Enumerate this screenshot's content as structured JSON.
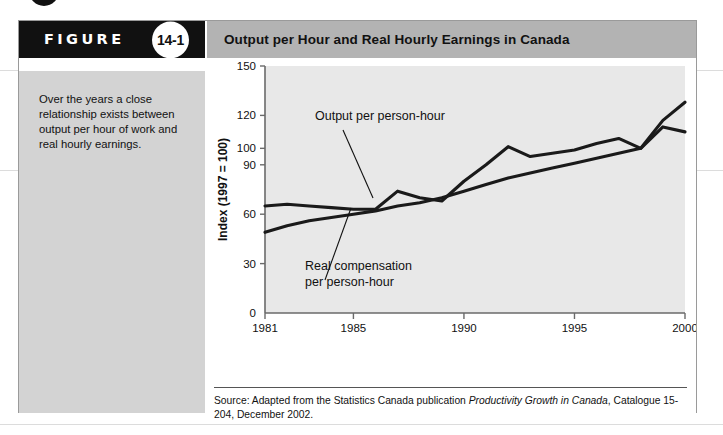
{
  "figure": {
    "badge_word": "FIGURE",
    "number": "14-1",
    "title": "Output per Hour and Real Hourly Earnings in Canada",
    "caption": "Over the years a close relationship exists between output per hour of work and real hourly earnings.",
    "source_prefix": "Source: Adapted from the Statistics Canada publication ",
    "source_italic": "Productivity Growth in Canada",
    "source_suffix": ", Catalogue 15-204, December 2002."
  },
  "colors": {
    "badge_background": "#111111",
    "title_background": "#b3b3b3",
    "caption_background": "#d3d3d3",
    "plot_background": "#e8e8e8",
    "line": "#1a1a1a",
    "panel_border": "#9a9a9a"
  },
  "chart_data": {
    "type": "line",
    "title": "Output per Hour and Real Hourly Earnings in Canada",
    "xlabel": "",
    "ylabel": "Index (1997 = 100)",
    "xlim": [
      1981,
      2000
    ],
    "ylim": [
      0,
      150
    ],
    "grid": false,
    "legend_position": "inline-annotations",
    "x_ticks": [
      1981,
      1985,
      1990,
      1995,
      2000
    ],
    "y_ticks": [
      0,
      30,
      60,
      90,
      100,
      120,
      150
    ],
    "x": [
      1981,
      1982,
      1983,
      1984,
      1985,
      1986,
      1987,
      1988,
      1989,
      1990,
      1991,
      1992,
      1993,
      1994,
      1995,
      1996,
      1997,
      1998,
      1999,
      2000
    ],
    "series": [
      {
        "name": "Output per person-hour",
        "values": [
          65,
          66,
          65,
          64,
          63,
          63,
          74,
          70,
          68,
          80,
          90,
          101,
          95,
          97,
          99,
          103,
          106,
          100,
          117,
          128
        ]
      },
      {
        "name": "Real compensation per person-hour",
        "values": [
          49,
          53,
          56,
          58,
          60,
          62,
          65,
          67,
          70,
          74,
          78,
          82,
          85,
          88,
          91,
          94,
          97,
          100,
          113,
          110
        ]
      }
    ],
    "annotations": [
      {
        "text": "Output per person-hour",
        "lines": [
          "Output per person-hour"
        ]
      },
      {
        "text": "Real compensation per person-hour",
        "lines": [
          "Real compensation",
          "per person-hour"
        ]
      }
    ]
  }
}
